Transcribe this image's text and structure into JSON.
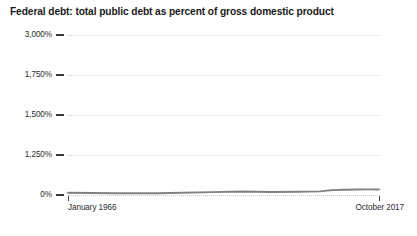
{
  "chart_data": {
    "type": "line",
    "title": "Federal debt: total public debt as percent of gross domestic product",
    "xlabel": "",
    "ylabel": "",
    "grid": true,
    "legend": false,
    "ylim": [
      0,
      3000
    ],
    "y_ticks": [
      {
        "label": "3,000%",
        "value": 3000
      },
      {
        "label": "1,750%",
        "value": 1750
      },
      {
        "label": "1,500%",
        "value": 1500
      },
      {
        "label": "1,250%",
        "value": 1250
      },
      {
        "label": "0%",
        "value": 0
      }
    ],
    "x_ticks": [
      {
        "label": "January 1966",
        "value": 1966.0
      },
      {
        "label": "October 2017",
        "value": 2017.75
      }
    ],
    "xlim": [
      1966.0,
      2017.75
    ],
    "series": [
      {
        "name": "Federal debt: total public debt as percent of gross domestic product",
        "color": "#808080",
        "x": [
          1966.0,
          1970.0,
          1974.0,
          1978.0,
          1981.0,
          1985.0,
          1990.0,
          1995.0,
          2000.0,
          2004.0,
          2008.0,
          2009.0,
          2010.0,
          2012.0,
          2014.0,
          2016.0,
          2017.75
        ],
        "values": [
          40.9,
          36.3,
          32.0,
          34.0,
          31.8,
          42.6,
          54.4,
          65.6,
          56.5,
          61.0,
          67.7,
          82.4,
          91.5,
          99.0,
          102.6,
          105.2,
          104.1
        ]
      }
    ]
  },
  "axis": {
    "tick_color": "#3a3a3a",
    "grid_color": "#d2d2d2"
  }
}
